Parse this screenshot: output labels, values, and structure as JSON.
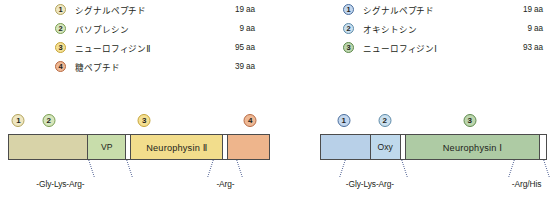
{
  "colors": {
    "signal_peptide_vp": "#d8d3a8",
    "vasopressin": "#c8ddab",
    "neurophysin_2": "#f2dd8c",
    "glycopeptide": "#eeb58c",
    "signal_peptide_oxy": "#b8d0e8",
    "oxytocin": "#bfd9ec",
    "neurophysin_1": "#aecba4",
    "badge_1_left_fill": "#efe7c2",
    "badge_1_left_border": "#b3a45c",
    "badge_2_left_fill": "#d6e6bc",
    "badge_2_left_border": "#7a9e52",
    "badge_3_left_fill": "#f5e093",
    "badge_3_left_border": "#c6a53a",
    "badge_4_left_fill": "#eeb894",
    "badge_4_left_border": "#b86a43",
    "badge_1_right_fill": "#c3d7ee",
    "badge_1_right_border": "#4a6e9e",
    "badge_2_right_fill": "#cae0ef",
    "badge_2_right_border": "#5d8aa8",
    "badge_3_right_fill": "#bcd6ae",
    "badge_3_right_border": "#5e8a4c",
    "bar_outline": "#4c4c4c",
    "leader_line": "#5b6b9a",
    "text": "#231f20"
  },
  "left_panel": {
    "legend": {
      "items": [
        {
          "number": "1",
          "name": "シグナルペプチド",
          "length": "19 aa"
        },
        {
          "number": "2",
          "name": "バソプレシン",
          "length": "9 aa"
        },
        {
          "number": "3",
          "name": "ニューロフィジンⅡ",
          "length": "95 aa"
        },
        {
          "number": "4",
          "name": "糖ペプチド",
          "length": "39 aa"
        }
      ]
    },
    "bar": {
      "segments": [
        {
          "id": "signal-peptide",
          "label": "",
          "width_pct": 30.5
        },
        {
          "id": "vasopressin",
          "label": "VP",
          "width_pct": 14.5
        },
        {
          "id": "spacer-1",
          "label": "",
          "width_pct": 2.0
        },
        {
          "id": "neurophysin-2",
          "label": "Neurophysin Ⅱ",
          "width_pct": 35.5
        },
        {
          "id": "spacer-2",
          "label": "",
          "width_pct": 1.6
        },
        {
          "id": "glycopeptide",
          "label": "",
          "width_pct": 15.9
        }
      ],
      "badges": [
        {
          "number": "1",
          "pos_pct": 4.0
        },
        {
          "number": "2",
          "pos_pct": 15.5
        },
        {
          "number": "3",
          "pos_pct": 52.0
        },
        {
          "number": "4",
          "pos_pct": 92.5
        }
      ],
      "cleavage_sites": [
        {
          "label": "-Gly-Lys-Arg-",
          "label_pos_pct": 20.0,
          "leader_left_pct": 31.5,
          "leader_right_pct": 46.0
        },
        {
          "label": "-Arg-",
          "label_pos_pct": 83.0,
          "leader_left_pct": 77.0,
          "leader_right_pct": 88.0
        }
      ]
    }
  },
  "right_panel": {
    "legend": {
      "items": [
        {
          "number": "1",
          "name": "シグナルペプチド",
          "length": "19 aa"
        },
        {
          "number": "2",
          "name": "オキシトシン",
          "length": "9 aa"
        },
        {
          "number": "3",
          "name": "ニューロフィジンⅠ",
          "length": "93 aa"
        }
      ]
    },
    "bar": {
      "segments": [
        {
          "id": "signal-peptide",
          "label": "",
          "width_pct": 22.0
        },
        {
          "id": "oxytocin",
          "label": "Oxy",
          "width_pct": 13.5
        },
        {
          "id": "spacer-1",
          "label": "",
          "width_pct": 2.3
        },
        {
          "id": "neurophysin-1",
          "label": "Neurophysin Ⅰ",
          "width_pct": 59.5
        },
        {
          "id": "spacer-2",
          "label": "",
          "width_pct": 2.7
        }
      ],
      "badges": [
        {
          "number": "1",
          "pos_pct": 10.5
        },
        {
          "number": "2",
          "pos_pct": 28.5
        },
        {
          "number": "3",
          "pos_pct": 66.0
        }
      ],
      "cleavage_sites": [
        {
          "label": "-Gly-Lys-Arg-",
          "label_pos_pct": 22.0,
          "leader_left_pct": 9.5,
          "leader_right_pct": 37.0
        },
        {
          "label": "-Arg/His",
          "label_pos_pct": 91.0,
          "leader_left_pct": 84.0,
          "leader_right_pct": 99.5
        }
      ]
    }
  }
}
